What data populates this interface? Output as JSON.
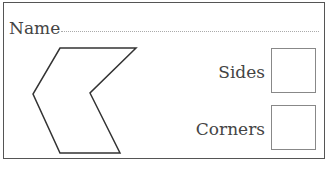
{
  "worksheet": {
    "name_label": "Name",
    "fields": {
      "sides_label": "Sides",
      "sides_value": "",
      "corners_label": "Corners",
      "corners_value": ""
    },
    "shape": {
      "type": "hexagon",
      "points": "56,45 132,45 86,90 116,150 56,150 29,91"
    }
  }
}
